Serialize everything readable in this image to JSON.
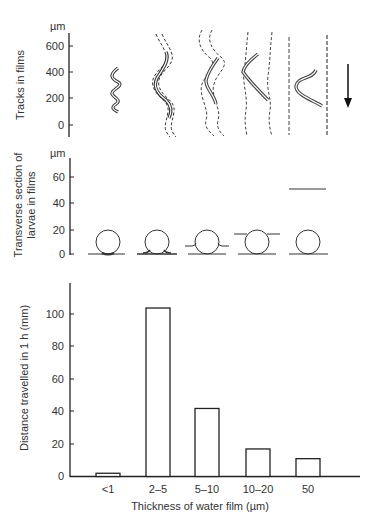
{
  "figure": {
    "panels": [
      {
        "id": "tracks",
        "ylabel": "Tracks in films",
        "unit": "µm",
        "yticks": [
          "600",
          "400",
          "200",
          "0"
        ]
      },
      {
        "id": "transverse",
        "ylabel_line1": "Transverse section of",
        "ylabel_line2": "larvae in films",
        "unit": "µm",
        "yticks": [
          "60",
          "40",
          "20",
          "0"
        ]
      },
      {
        "id": "distance",
        "ylabel": "Distance travelled in 1 h (mm)",
        "yticks": [
          "100",
          "80",
          "60",
          "40",
          "20",
          "0"
        ],
        "xlabel": "Thickness of water film (µm)",
        "categories": [
          "<1",
          "2–5",
          "5–10",
          "10–20",
          "50"
        ]
      }
    ],
    "direction_arrow": "arrow-down-icon"
  },
  "chart_data": [
    {
      "type": "diagram",
      "title": "Tracks in films",
      "ylabel": "Tracks in films (µm)",
      "ylim": [
        -50,
        700
      ],
      "yticks": [
        0,
        200,
        400,
        600
      ],
      "categories": [
        "<1",
        "2–5",
        "5–10",
        "10–20",
        "50"
      ],
      "notes": "Sinusoidal larval tracks widen and flatten with increasing film thickness; dashed lines mark track edges; arrow indicates direction of movement (downward)."
    },
    {
      "type": "diagram",
      "title": "Transverse section of larvae in films",
      "ylabel": "Transverse section of larvae in films (µm)",
      "ylim": [
        0,
        70
      ],
      "yticks": [
        0,
        20,
        40,
        60
      ],
      "categories": [
        "<1",
        "2–5",
        "5–10",
        "10–20",
        "50"
      ],
      "larva_diameter_um": 20,
      "film_surface_height_um": [
        0,
        1,
        8,
        16,
        50
      ]
    },
    {
      "type": "bar",
      "title": "",
      "xlabel": "Thickness of water film (µm)",
      "ylabel": "Distance travelled in 1 h (mm)",
      "categories": [
        "<1",
        "2–5",
        "5–10",
        "10–20",
        "50"
      ],
      "values": [
        2,
        104,
        42,
        17,
        11
      ],
      "ylim": [
        0,
        115
      ],
      "yticks": [
        0,
        20,
        40,
        60,
        80,
        100
      ],
      "grid": false,
      "legend": null
    }
  ]
}
